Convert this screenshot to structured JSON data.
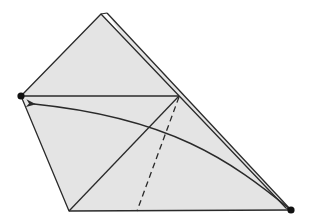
{
  "diagram": {
    "type": "origami-fold-step",
    "colors": {
      "paper_fill": "#e4e4e4",
      "stroke": "#2a2a2a",
      "background": "#ffffff"
    },
    "points": {
      "back_apex": [
        107,
        13
      ],
      "front_apex": [
        101,
        14
      ],
      "left_dot": [
        21,
        96
      ],
      "crease_top": [
        179,
        96
      ],
      "bottom_left": [
        69,
        211
      ],
      "dashed_bottom": [
        137,
        211
      ],
      "right_dot": [
        291,
        210
      ],
      "arrow_tip": [
        32,
        104
      ]
    },
    "elements": [
      {
        "name": "paper-outline",
        "kind": "polygon"
      },
      {
        "name": "back-layer-edge",
        "kind": "line"
      },
      {
        "name": "horizontal-crease",
        "kind": "line"
      },
      {
        "name": "diagonal-edge",
        "kind": "line"
      },
      {
        "name": "valley-fold-line",
        "kind": "dashed-line"
      },
      {
        "name": "fold-arrow",
        "kind": "curved-arrow"
      },
      {
        "name": "reference-dot-left",
        "kind": "dot"
      },
      {
        "name": "reference-dot-right",
        "kind": "dot"
      }
    ]
  }
}
